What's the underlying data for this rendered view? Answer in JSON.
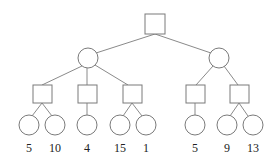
{
  "diagram": {
    "type": "game-tree",
    "colors": {
      "stroke": "#7a7a7a",
      "background": "#ffffff",
      "text": "#222222"
    },
    "root": {
      "shape": "square"
    },
    "level1": [
      {
        "shape": "circle",
        "children": 3
      },
      {
        "shape": "circle",
        "children": 2
      }
    ],
    "level2": [
      {
        "shape": "square",
        "parent": 0,
        "children": 2
      },
      {
        "shape": "square",
        "parent": 0,
        "children": 1
      },
      {
        "shape": "square",
        "parent": 0,
        "children": 2
      },
      {
        "shape": "square",
        "parent": 1,
        "children": 1
      },
      {
        "shape": "square",
        "parent": 1,
        "children": 2
      }
    ],
    "leaves": [
      {
        "shape": "circle",
        "value": "5"
      },
      {
        "shape": "circle",
        "value": "10"
      },
      {
        "shape": "circle",
        "value": "4"
      },
      {
        "shape": "circle",
        "value": "15"
      },
      {
        "shape": "circle",
        "value": "1"
      },
      {
        "shape": "circle",
        "value": "5"
      },
      {
        "shape": "circle",
        "value": "9"
      },
      {
        "shape": "circle",
        "value": "13"
      }
    ]
  }
}
